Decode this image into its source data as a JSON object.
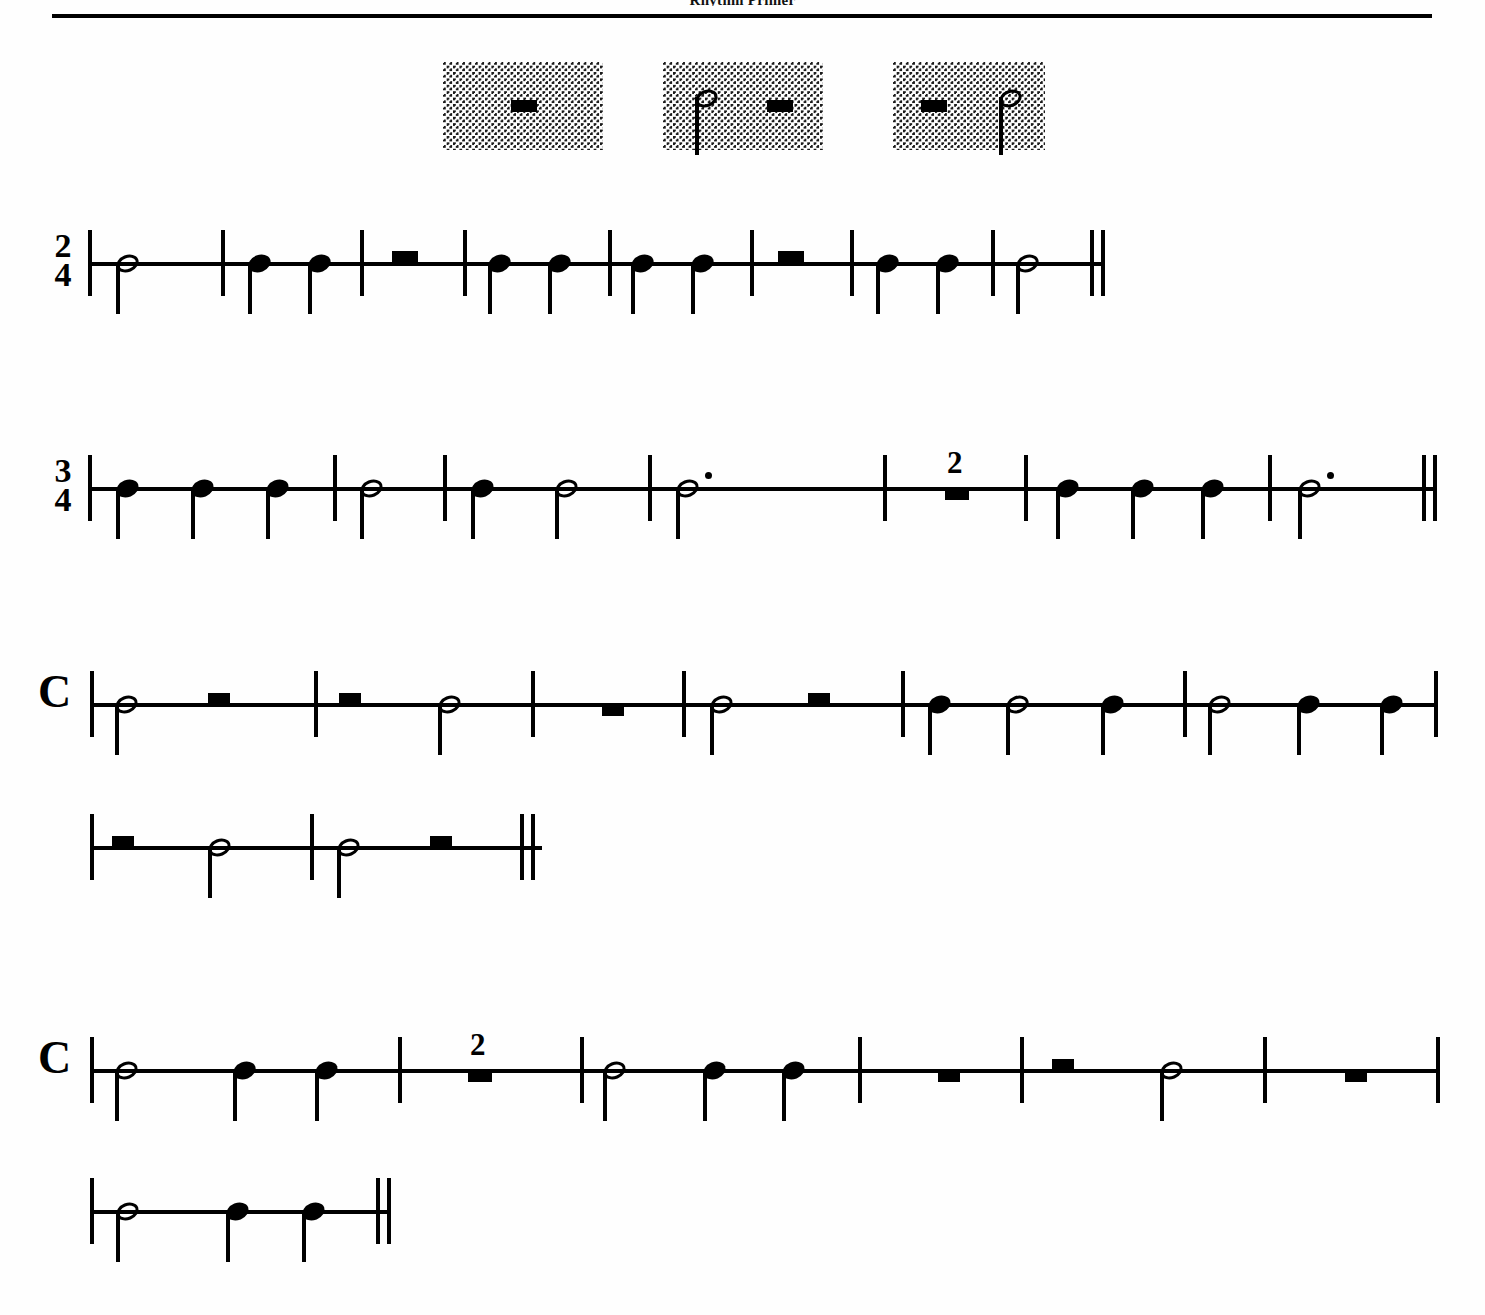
{
  "header": {
    "title": "Rhythm Primer",
    "rule": "horizontal-rule"
  },
  "examples": {
    "label": "shaded rhythm examples",
    "boxes": [
      {
        "id": "example-box-1",
        "x": 443,
        "y": 62,
        "width": 160,
        "items": [
          {
            "type": "half-rest",
            "x": 68
          }
        ]
      },
      {
        "id": "example-box-2",
        "x": 663,
        "y": 62,
        "width": 160,
        "items": [
          {
            "type": "half-note",
            "x": 32
          },
          {
            "type": "half-rest",
            "x": 104
          }
        ]
      },
      {
        "id": "example-box-3",
        "x": 893,
        "y": 62,
        "width": 152,
        "items": [
          {
            "type": "half-rest",
            "x": 28
          },
          {
            "type": "half-note",
            "x": 106
          }
        ]
      }
    ]
  },
  "chart_data": {
    "type": "table",
    "title": "Rhythm Primer",
    "notation": "single-line rhythm staff",
    "systems": [
      {
        "id": "system-1",
        "time_signature": "2/4",
        "time_signature_numerator": "2",
        "time_signature_denominator": "4",
        "staff_x": 88,
        "staff_y": 262,
        "staff_width": 1016,
        "end_barline": "final-double",
        "measures": [
          {
            "index": 1,
            "events": [
              {
                "type": "half-note",
                "beats": 2
              }
            ]
          },
          {
            "index": 2,
            "events": [
              {
                "type": "quarter-note",
                "beats": 1
              },
              {
                "type": "quarter-note",
                "beats": 1
              }
            ]
          },
          {
            "index": 3,
            "events": [
              {
                "type": "half-rest",
                "beats": 2
              }
            ]
          },
          {
            "index": 4,
            "events": [
              {
                "type": "quarter-note",
                "beats": 1
              },
              {
                "type": "quarter-note",
                "beats": 1
              }
            ]
          },
          {
            "index": 5,
            "events": [
              {
                "type": "quarter-note",
                "beats": 1
              },
              {
                "type": "quarter-note",
                "beats": 1
              }
            ]
          },
          {
            "index": 6,
            "events": [
              {
                "type": "half-rest",
                "beats": 2
              }
            ]
          },
          {
            "index": 7,
            "events": [
              {
                "type": "quarter-note",
                "beats": 1
              },
              {
                "type": "quarter-note",
                "beats": 1
              }
            ]
          },
          {
            "index": 8,
            "events": [
              {
                "type": "half-note",
                "beats": 2
              }
            ]
          }
        ],
        "glyphs": [
          {
            "g": "barline",
            "x": 0
          },
          {
            "g": "half-note",
            "x": 28
          },
          {
            "g": "barline",
            "x": 133
          },
          {
            "g": "quarter-note",
            "x": 160
          },
          {
            "g": "quarter-note",
            "x": 220
          },
          {
            "g": "barline",
            "x": 272
          },
          {
            "g": "half-rest",
            "x": 304
          },
          {
            "g": "barline",
            "x": 375
          },
          {
            "g": "quarter-note",
            "x": 400
          },
          {
            "g": "quarter-note",
            "x": 460
          },
          {
            "g": "barline",
            "x": 520
          },
          {
            "g": "quarter-note",
            "x": 543
          },
          {
            "g": "quarter-note",
            "x": 603
          },
          {
            "g": "barline",
            "x": 662
          },
          {
            "g": "half-rest",
            "x": 690
          },
          {
            "g": "barline",
            "x": 762
          },
          {
            "g": "quarter-note",
            "x": 788
          },
          {
            "g": "quarter-note",
            "x": 848
          },
          {
            "g": "barline",
            "x": 903
          },
          {
            "g": "half-note",
            "x": 928
          },
          {
            "g": "final",
            "x": 1002
          }
        ]
      },
      {
        "id": "system-2",
        "time_signature": "3/4",
        "time_signature_numerator": "3",
        "time_signature_denominator": "4",
        "staff_x": 88,
        "staff_y": 487,
        "staff_width": 1348,
        "end_barline": "final-double",
        "measures": [
          {
            "index": 1,
            "events": [
              {
                "type": "quarter-note",
                "beats": 1
              },
              {
                "type": "quarter-note",
                "beats": 1
              },
              {
                "type": "quarter-note",
                "beats": 1
              }
            ]
          },
          {
            "index": 2,
            "events": [
              {
                "type": "half-note",
                "beats": 2
              },
              {
                "type": "quarter-note",
                "beats": 1
              }
            ]
          },
          {
            "index": 3,
            "events": [
              {
                "type": "quarter-note",
                "beats": 1
              },
              {
                "type": "half-note",
                "beats": 2
              }
            ]
          },
          {
            "index": 4,
            "events": [
              {
                "type": "dotted-half-note",
                "beats": 3
              }
            ]
          },
          {
            "index": 5,
            "events": [
              {
                "type": "multi-measure-rest",
                "count": "2",
                "beats": 6
              }
            ]
          },
          {
            "index": 6,
            "events": [
              {
                "type": "quarter-note",
                "beats": 1
              },
              {
                "type": "quarter-note",
                "beats": 1
              },
              {
                "type": "quarter-note",
                "beats": 1
              }
            ]
          },
          {
            "index": 7,
            "events": [
              {
                "type": "dotted-half-note",
                "beats": 3
              }
            ]
          }
        ],
        "glyphs": [
          {
            "g": "barline",
            "x": 0
          },
          {
            "g": "quarter-note",
            "x": 28
          },
          {
            "g": "quarter-note",
            "x": 103
          },
          {
            "g": "quarter-note",
            "x": 178
          },
          {
            "g": "barline",
            "x": 245
          },
          {
            "g": "quarter-note",
            "x": 383
          },
          {
            "g": "half-note",
            "x": 467
          },
          {
            "g": "half-note",
            "x": 272
          },
          {
            "g": "barline",
            "x": 355
          },
          {
            "g": "barline",
            "x": 560
          },
          {
            "g": "dotted-half-note",
            "x": 588
          },
          {
            "g": "barline",
            "x": 795
          },
          {
            "g": "multi-measure-rest",
            "x": 857
          },
          {
            "g": "barline",
            "x": 936
          },
          {
            "g": "quarter-note",
            "x": 968
          },
          {
            "g": "quarter-note",
            "x": 1043
          },
          {
            "g": "quarter-note",
            "x": 1113
          },
          {
            "g": "barline",
            "x": 1180
          },
          {
            "g": "dotted-half-note",
            "x": 1210
          },
          {
            "g": "final",
            "x": 1334
          }
        ]
      },
      {
        "id": "system-3",
        "time_signature": "common-time",
        "time_signature_symbol": "C",
        "staff_x": 90,
        "staff_y": 703,
        "staff_width": 1348,
        "end_barline": "thin",
        "measures": [
          {
            "index": 1,
            "events": [
              {
                "type": "half-note",
                "beats": 2
              },
              {
                "type": "half-rest",
                "beats": 2
              }
            ]
          },
          {
            "index": 2,
            "events": [
              {
                "type": "half-rest",
                "beats": 2
              },
              {
                "type": "half-note",
                "beats": 2
              }
            ]
          },
          {
            "index": 3,
            "events": [
              {
                "type": "whole-rest",
                "beats": 4
              }
            ]
          },
          {
            "index": 4,
            "events": [
              {
                "type": "half-note",
                "beats": 2
              },
              {
                "type": "half-rest",
                "beats": 2
              }
            ]
          },
          {
            "index": 5,
            "events": [
              {
                "type": "quarter-note",
                "beats": 1
              },
              {
                "type": "half-note",
                "beats": 2
              },
              {
                "type": "quarter-note",
                "beats": 1
              }
            ]
          },
          {
            "index": 6,
            "events": [
              {
                "type": "half-note",
                "beats": 2
              },
              {
                "type": "quarter-note",
                "beats": 1
              },
              {
                "type": "quarter-note",
                "beats": 1
              }
            ]
          }
        ],
        "glyphs": [
          {
            "g": "barline",
            "x": 0
          },
          {
            "g": "half-note",
            "x": 25
          },
          {
            "g": "half-rest-small",
            "x": 118
          },
          {
            "g": "barline",
            "x": 224
          },
          {
            "g": "half-rest-small",
            "x": 249
          },
          {
            "g": "half-note",
            "x": 348
          },
          {
            "g": "barline",
            "x": 441
          },
          {
            "g": "whole-rest-small",
            "x": 512
          },
          {
            "g": "barline",
            "x": 592
          },
          {
            "g": "half-note",
            "x": 620
          },
          {
            "g": "half-rest-small",
            "x": 718
          },
          {
            "g": "barline",
            "x": 811
          },
          {
            "g": "quarter-note",
            "x": 838
          },
          {
            "g": "half-note",
            "x": 916
          },
          {
            "g": "quarter-note",
            "x": 1011
          },
          {
            "g": "barline",
            "x": 1093
          },
          {
            "g": "half-note",
            "x": 1118
          },
          {
            "g": "quarter-note",
            "x": 1207
          },
          {
            "g": "quarter-note",
            "x": 1290
          },
          {
            "g": "barline",
            "x": 1344
          }
        ]
      },
      {
        "id": "system-3-continuation",
        "time_signature": "",
        "staff_x": 90,
        "staff_y": 846,
        "staff_width": 452,
        "end_barline": "final-double",
        "measures": [
          {
            "index": 7,
            "events": [
              {
                "type": "half-rest",
                "beats": 2
              },
              {
                "type": "half-note",
                "beats": 2
              }
            ]
          },
          {
            "index": 8,
            "events": [
              {
                "type": "half-note",
                "beats": 2
              },
              {
                "type": "half-rest",
                "beats": 2
              }
            ]
          }
        ],
        "glyphs": [
          {
            "g": "barline",
            "x": 0
          },
          {
            "g": "half-rest-small",
            "x": 22
          },
          {
            "g": "half-note",
            "x": 118
          },
          {
            "g": "barline",
            "x": 220
          },
          {
            "g": "half-note",
            "x": 247
          },
          {
            "g": "half-rest-small",
            "x": 340
          },
          {
            "g": "final",
            "x": 430
          }
        ]
      },
      {
        "id": "system-4",
        "time_signature": "common-time",
        "time_signature_symbol": "C",
        "staff_x": 90,
        "staff_y": 1069,
        "staff_width": 1350,
        "end_barline": "thin",
        "measures": [
          {
            "index": 1,
            "events": [
              {
                "type": "half-note",
                "beats": 2
              },
              {
                "type": "quarter-note",
                "beats": 1
              },
              {
                "type": "quarter-note",
                "beats": 1
              }
            ]
          },
          {
            "index": 2,
            "events": [
              {
                "type": "multi-measure-rest",
                "count": "2",
                "beats": 8
              }
            ]
          },
          {
            "index": 3,
            "events": [
              {
                "type": "half-note",
                "beats": 2
              },
              {
                "type": "quarter-note",
                "beats": 1
              },
              {
                "type": "quarter-note",
                "beats": 1
              }
            ]
          },
          {
            "index": 4,
            "events": [
              {
                "type": "whole-rest",
                "beats": 4
              }
            ]
          },
          {
            "index": 5,
            "events": [
              {
                "type": "half-rest",
                "beats": 2
              },
              {
                "type": "half-note",
                "beats": 2
              }
            ]
          },
          {
            "index": 6,
            "events": [
              {
                "type": "whole-rest",
                "beats": 4
              }
            ]
          }
        ],
        "glyphs": [
          {
            "g": "barline",
            "x": 0
          },
          {
            "g": "half-note",
            "x": 25
          },
          {
            "g": "quarter-note",
            "x": 143
          },
          {
            "g": "quarter-note",
            "x": 225
          },
          {
            "g": "barline",
            "x": 308
          },
          {
            "g": "multi-measure-rest",
            "x": 378
          },
          {
            "g": "barline",
            "x": 490
          },
          {
            "g": "half-note",
            "x": 513
          },
          {
            "g": "quarter-note",
            "x": 613
          },
          {
            "g": "quarter-note",
            "x": 692
          },
          {
            "g": "barline",
            "x": 768
          },
          {
            "g": "whole-rest-small",
            "x": 848
          },
          {
            "g": "barline",
            "x": 930
          },
          {
            "g": "half-rest-small",
            "x": 962
          },
          {
            "g": "half-note",
            "x": 1070
          },
          {
            "g": "barline",
            "x": 1173
          },
          {
            "g": "whole-rest-small",
            "x": 1255
          },
          {
            "g": "barline",
            "x": 1346
          }
        ]
      },
      {
        "id": "system-4-continuation",
        "time_signature": "",
        "staff_x": 90,
        "staff_y": 1210,
        "staff_width": 300,
        "end_barline": "final-double",
        "measures": [
          {
            "index": 7,
            "events": [
              {
                "type": "half-note",
                "beats": 2
              },
              {
                "type": "quarter-note",
                "beats": 1
              },
              {
                "type": "quarter-note",
                "beats": 1
              }
            ]
          }
        ],
        "glyphs": [
          {
            "g": "barline",
            "x": 0
          },
          {
            "g": "half-note",
            "x": 26
          },
          {
            "g": "quarter-note",
            "x": 136
          },
          {
            "g": "quarter-note",
            "x": 212
          },
          {
            "g": "final",
            "x": 286
          }
        ]
      }
    ]
  }
}
